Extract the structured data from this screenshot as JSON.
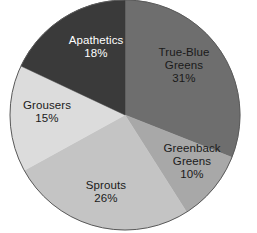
{
  "chart_data": {
    "type": "pie",
    "title": "",
    "subtitle": "",
    "xlabel": "",
    "ylabel": "",
    "legend_position": "none",
    "grid": false,
    "labels_inside_slices": true,
    "start_angle_deg": 0,
    "direction": "clockwise",
    "categories": [
      "True-Blue Greens",
      "Greenback Greens",
      "Sprouts",
      "Grousers",
      "Apathetics"
    ],
    "values": [
      31,
      10,
      26,
      15,
      18
    ],
    "value_suffix": "%",
    "slices": [
      {
        "name": "True-Blue Greens",
        "label_line1": "True-Blue",
        "label_line2": "Greens",
        "value": 31,
        "value_text": "31%",
        "color": "#6e6e6e",
        "text_color": "#1a1a1a",
        "start_deg": 0,
        "end_deg": 111.6
      },
      {
        "name": "Greenback Greens",
        "label_line1": "Greenback",
        "label_line2": "Greens",
        "value": 10,
        "value_text": "10%",
        "color": "#a8a8a8",
        "text_color": "#1a1a1a",
        "start_deg": 111.6,
        "end_deg": 147.6
      },
      {
        "name": "Sprouts",
        "label_line1": "Sprouts",
        "label_line2": "",
        "value": 26,
        "value_text": "26%",
        "color": "#c4c4c4",
        "text_color": "#1a1a1a",
        "start_deg": 147.6,
        "end_deg": 241.2
      },
      {
        "name": "Grousers",
        "label_line1": "Grousers",
        "label_line2": "",
        "value": 15,
        "value_text": "15%",
        "color": "#dcdcdc",
        "text_color": "#1a1a1a",
        "start_deg": 241.2,
        "end_deg": 295.2
      },
      {
        "name": "Apathetics",
        "label_line1": "Apathetics",
        "label_line2": "",
        "value": 18,
        "value_text": "18%",
        "color": "#3a3a3a",
        "text_color": "#ffffff",
        "start_deg": 295.2,
        "end_deg": 360
      }
    ],
    "geometry": {
      "center_x": 125,
      "center_y": 115,
      "radius": 115
    },
    "outline_color": "#5a5a5a",
    "background_color": "#ffffff"
  }
}
